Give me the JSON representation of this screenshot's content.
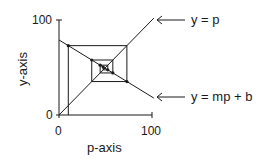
{
  "diagram": {
    "type": "cobweb",
    "x_axis": {
      "label": "p-axis",
      "ticks": [
        "0",
        "100"
      ],
      "range": [
        0,
        100
      ]
    },
    "y_axis": {
      "label": "y-axis",
      "ticks": [
        "0",
        "100"
      ],
      "range": [
        0,
        100
      ]
    },
    "lines": [
      {
        "name": "identity",
        "equation_label": "y = p",
        "slope": 1,
        "intercept": 0
      },
      {
        "name": "linear-map",
        "equation_label": "y = mp + b",
        "slope": -0.6,
        "intercept": 79
      }
    ],
    "cobweb": {
      "start_p": 10,
      "iterations": 6
    },
    "colors": {
      "stroke": "#1a1a1a",
      "background": "#ffffff"
    }
  }
}
